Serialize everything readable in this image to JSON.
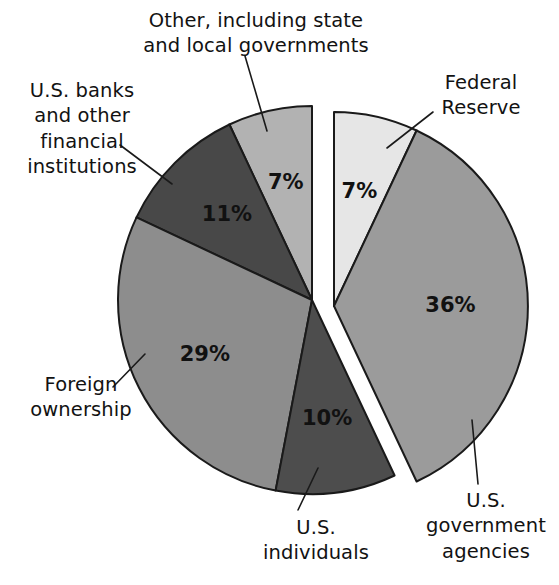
{
  "chart_data": {
    "type": "pie",
    "title": "",
    "subtitle": "",
    "xlabel": "",
    "ylabel": "",
    "legend_position": "callout-labels",
    "grid": false,
    "units": "percent",
    "total": 100,
    "exploded_group": [
      "Federal Reserve",
      "U.S. government agencies"
    ],
    "categories": [
      "Other, including state and local governments",
      "Federal Reserve",
      "U.S. government agencies",
      "U.S. individuals",
      "Foreign ownership",
      "U.S. banks and other financial institutions"
    ],
    "values": [
      7,
      7,
      36,
      10,
      29,
      11
    ],
    "slices": [
      {
        "id": "other",
        "label": "Other, including state\nand local governments",
        "value": 7,
        "value_text": "7%",
        "color": "#b2b2b2",
        "exploded": false
      },
      {
        "id": "federal-reserve",
        "label": "Federal\nReserve",
        "value": 7,
        "value_text": "7%",
        "color": "#e6e6e6",
        "exploded": true
      },
      {
        "id": "us-government-agencies",
        "label": "U.S.\ngovernment\nagencies",
        "value": 36,
        "value_text": "36%",
        "color": "#9b9b9b",
        "exploded": true
      },
      {
        "id": "us-individuals",
        "label": "U.S.\nindividuals",
        "value": 10,
        "value_text": "10%",
        "color": "#4d4d4d",
        "exploded": false
      },
      {
        "id": "foreign-ownership",
        "label": "Foreign\nownership",
        "value": 29,
        "value_text": "29%",
        "color": "#8d8d8d",
        "exploded": false
      },
      {
        "id": "us-banks",
        "label": "U.S. banks\nand other\nfinancial\ninstitutions",
        "value": 11,
        "value_text": "11%",
        "color": "#484848",
        "exploded": false
      }
    ]
  },
  "labels": {
    "other": "Other, including state\nand local governments",
    "banks": "U.S. banks\nand other\nfinancial\ninstitutions",
    "foreign": "Foreign\nownership",
    "individuals": "U.S.\nindividuals",
    "federal_reserve": "Federal\nReserve",
    "government_agencies": "U.S.\ngovernment\nagencies"
  },
  "values": {
    "other": "7%",
    "banks": "11%",
    "foreign": "29%",
    "individuals": "10%",
    "federal_reserve": "7%",
    "government_agencies": "36%"
  },
  "colors": {
    "background": "#ffffff",
    "outline": "#1a1a1a",
    "text": "#121212",
    "other": "#b2b2b2",
    "banks": "#484848",
    "foreign": "#8d8d8d",
    "individuals": "#4d4d4d",
    "federal_reserve": "#e6e6e6",
    "government_agencies": "#9b9b9b"
  }
}
